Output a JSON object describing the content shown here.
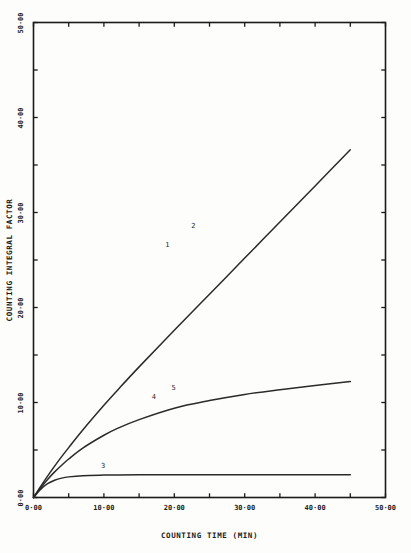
{
  "chart_data": {
    "type": "line",
    "title": "",
    "xlabel": "COUNTING TIME (MIN)",
    "ylabel": "COUNTING INTEGRAL FACTOR",
    "xlim": [
      0,
      50
    ],
    "ylim": [
      0,
      50
    ],
    "grid": false,
    "legend_position": "inline-curve-labels",
    "xticklabels": [
      "0·00",
      "10·00",
      "20·00",
      "30·00",
      "40·00",
      "50·00"
    ],
    "xtickvalues": [
      0,
      10,
      20,
      30,
      40,
      50
    ],
    "yticklabels": [
      "0·00",
      "10·00",
      "20·00",
      "30·00",
      "40·00",
      "50·00"
    ],
    "ytickvalues": [
      0,
      10,
      20,
      30,
      40,
      50
    ],
    "minor_tick_step": 5,
    "axis_color": "#1a1a1a",
    "curve_color": "#2a2a2a",
    "background_color": "#fdfdfb",
    "x": [
      0,
      1,
      2,
      3,
      4,
      5,
      7,
      10,
      12,
      15,
      20,
      25,
      30,
      35,
      40,
      45
    ],
    "series": [
      {
        "name": "1",
        "label": "1",
        "label_x": 19.0,
        "label_y": 26.6,
        "values": [
          0,
          1.15,
          2.25,
          3.3,
          4.3,
          5.25,
          7.1,
          9.7,
          11.35,
          13.75,
          17.6,
          21.4,
          25.2,
          29.0,
          32.8,
          36.6
        ]
      },
      {
        "name": "2",
        "label": "2",
        "label_x": 22.7,
        "label_y": 28.6,
        "values": [
          0,
          1.15,
          2.25,
          3.3,
          4.3,
          5.25,
          7.1,
          9.7,
          11.35,
          13.75,
          17.6,
          21.4,
          25.2,
          29.0,
          32.8,
          36.6
        ]
      },
      {
        "name": "4",
        "label": "4",
        "label_x": 17.1,
        "label_y": 10.6,
        "values": [
          0,
          1.0,
          1.9,
          2.7,
          3.4,
          4.05,
          5.2,
          6.55,
          7.3,
          8.2,
          9.4,
          10.2,
          10.85,
          11.35,
          11.8,
          12.2
        ]
      },
      {
        "name": "5",
        "label": "5",
        "label_x": 19.9,
        "label_y": 11.55,
        "values": [
          0,
          1.0,
          1.9,
          2.7,
          3.4,
          4.05,
          5.2,
          6.55,
          7.3,
          8.2,
          9.4,
          10.2,
          10.85,
          11.35,
          11.8,
          12.2
        ]
      },
      {
        "name": "3",
        "label": "3",
        "label_x": 9.9,
        "label_y": 3.35,
        "values": [
          0,
          0.85,
          1.45,
          1.82,
          2.04,
          2.17,
          2.3,
          2.36,
          2.38,
          2.4,
          2.4,
          2.4,
          2.4,
          2.4,
          2.4,
          2.4
        ]
      }
    ]
  }
}
